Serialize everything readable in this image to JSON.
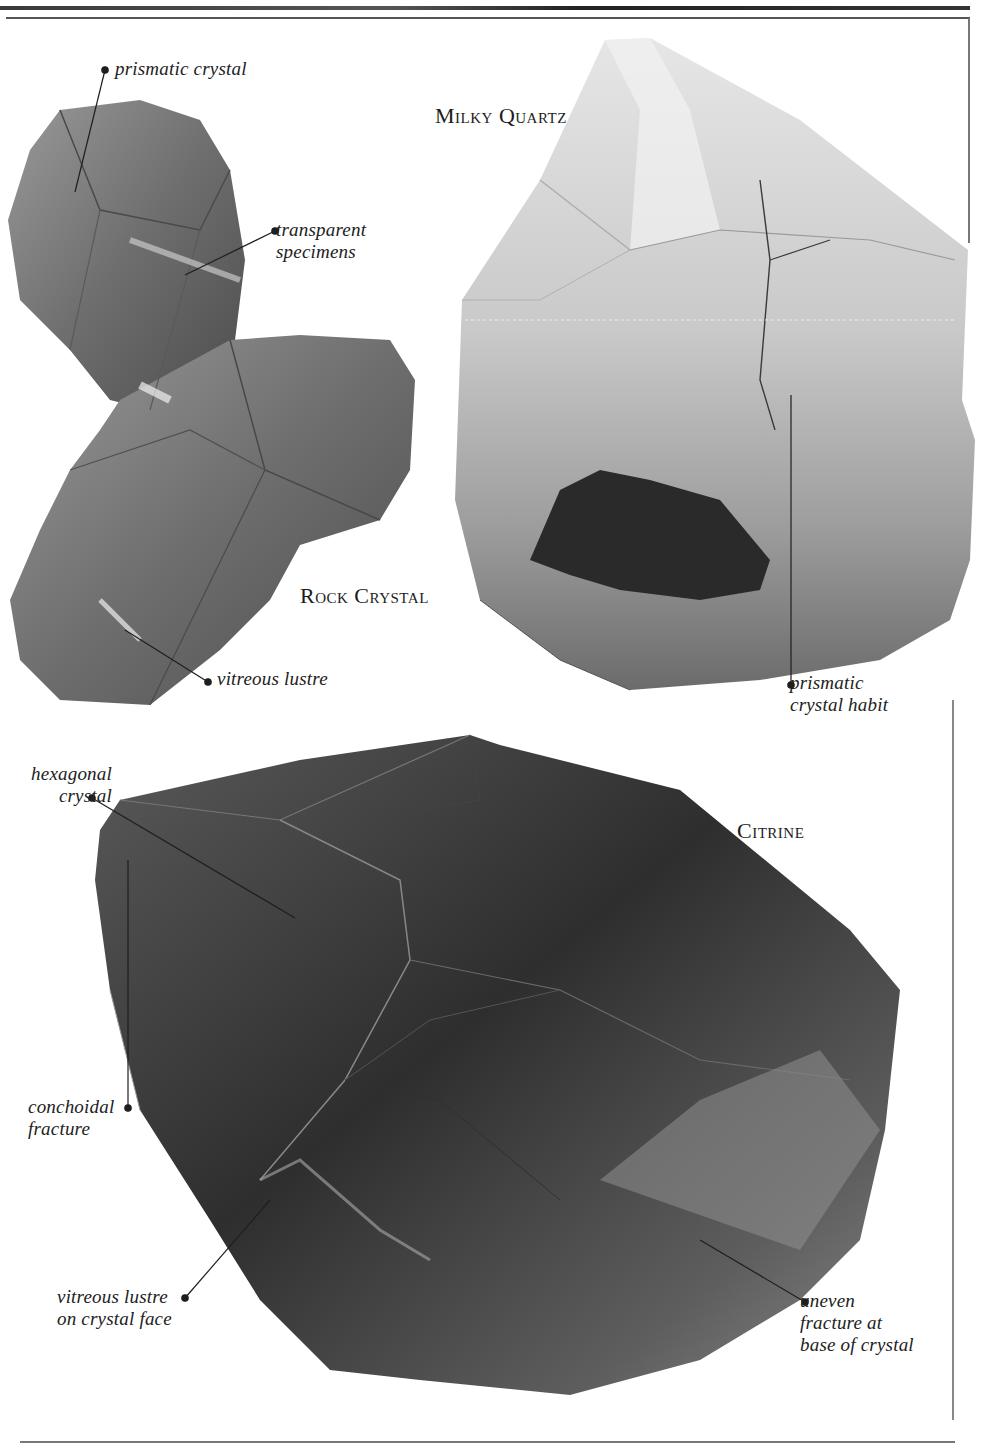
{
  "specimens": {
    "rock_crystal": {
      "title": "Rock Crystal",
      "labels": {
        "prismatic_crystal": "prismatic crystal",
        "transparent_specimens": "transparent\nspecimens",
        "vitreous_lustre": "vitreous lustre"
      }
    },
    "milky_quartz": {
      "title": "Milky Quartz",
      "labels": {
        "prismatic_crystal_habit": "prismatic\ncrystal habit"
      }
    },
    "citrine": {
      "title": "Citrine",
      "labels": {
        "hexagonal_crystal": "hexagonal\ncrystal",
        "conchoidal_fracture": "conchoidal\nfracture",
        "vitreous_lustre_face": "vitreous lustre\non crystal face",
        "uneven_fracture": "uneven\nfracture at\nbase of crystal"
      }
    }
  },
  "colors": {
    "paper": "#ffffff",
    "ink": "#1e1e1e",
    "rule": "#444444"
  }
}
